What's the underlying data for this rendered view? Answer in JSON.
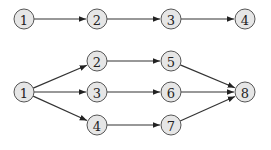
{
  "diagram1": {
    "nodes": [
      {
        "id": "a1",
        "label": "1",
        "x": 24,
        "y": 19
      },
      {
        "id": "a2",
        "label": "2",
        "x": 97,
        "y": 19
      },
      {
        "id": "a3",
        "label": "3",
        "x": 171,
        "y": 19
      },
      {
        "id": "a4",
        "label": "4",
        "x": 245,
        "y": 19
      }
    ],
    "edges": [
      [
        "a1",
        "a2"
      ],
      [
        "a2",
        "a3"
      ],
      [
        "a3",
        "a4"
      ]
    ]
  },
  "diagram2": {
    "nodes": [
      {
        "id": "b1",
        "label": "1",
        "x": 24,
        "y": 92
      },
      {
        "id": "b2",
        "label": "2",
        "x": 97,
        "y": 61
      },
      {
        "id": "b3",
        "label": "3",
        "x": 97,
        "y": 92
      },
      {
        "id": "b4",
        "label": "4",
        "x": 97,
        "y": 125
      },
      {
        "id": "b5",
        "label": "5",
        "x": 171,
        "y": 61
      },
      {
        "id": "b6",
        "label": "6",
        "x": 171,
        "y": 92
      },
      {
        "id": "b7",
        "label": "7",
        "x": 171,
        "y": 125
      },
      {
        "id": "b8",
        "label": "8",
        "x": 245,
        "y": 92
      }
    ],
    "edges": [
      [
        "b1",
        "b2"
      ],
      [
        "b1",
        "b3"
      ],
      [
        "b1",
        "b4"
      ],
      [
        "b2",
        "b5"
      ],
      [
        "b3",
        "b6"
      ],
      [
        "b4",
        "b7"
      ],
      [
        "b5",
        "b8"
      ],
      [
        "b6",
        "b8"
      ],
      [
        "b7",
        "b8"
      ]
    ]
  }
}
